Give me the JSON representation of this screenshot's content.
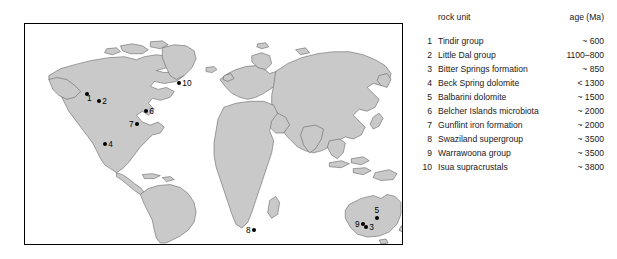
{
  "figure": {
    "background_color": "#ffffff",
    "land_fill_color": "#c9c9c9",
    "land_stroke_color": "#5a5a5a",
    "marker_color": "#000000",
    "map_border_color": "#000000"
  },
  "map": {
    "title": "",
    "projection_note": "",
    "markers": [
      {
        "id": "1",
        "label": "1",
        "x": 62,
        "y": 70,
        "label_side": "left",
        "region": "northwest-north-america"
      },
      {
        "id": "2",
        "label": "2",
        "x": 74,
        "y": 77,
        "label_side": "right",
        "region": "northwest-canada"
      },
      {
        "id": "3",
        "label": "3",
        "x": 341,
        "y": 203,
        "label_side": "right",
        "region": "central-australia"
      },
      {
        "id": "4",
        "label": "4",
        "x": 80,
        "y": 120,
        "label_side": "right",
        "region": "southwest-usa"
      },
      {
        "id": "5",
        "label": "5",
        "x": 352,
        "y": 192,
        "label_side": "left",
        "region": "northern-australia"
      },
      {
        "id": "6",
        "label": "6",
        "x": 121,
        "y": 87,
        "label_side": "right",
        "region": "hudson-bay"
      },
      {
        "id": "7",
        "label": "7",
        "x": 112,
        "y": 100,
        "label_side": "left",
        "region": "great-lakes"
      },
      {
        "id": "8",
        "label": "8",
        "x": 229,
        "y": 206,
        "label_side": "left",
        "region": "southern-africa"
      },
      {
        "id": "9",
        "label": "9",
        "x": 338,
        "y": 200,
        "label_side": "left",
        "region": "western-australia"
      },
      {
        "id": "10",
        "label": "10",
        "x": 154,
        "y": 59,
        "label_side": "right",
        "region": "greenland"
      }
    ]
  },
  "legend": {
    "header": {
      "unit_label": "rock unit",
      "age_label": "age (Ma)"
    },
    "rows": [
      {
        "num": "1",
        "unit": "Tindir group",
        "age": "~ 600"
      },
      {
        "num": "2",
        "unit": "Little Dal group",
        "age": "1100–800"
      },
      {
        "num": "3",
        "unit": "Bitter Springs formation",
        "age": "~ 850"
      },
      {
        "num": "4",
        "unit": "Beck Spring dolomite",
        "age": "< 1300"
      },
      {
        "num": "5",
        "unit": "Balbarini dolomite",
        "age": "~ 1500"
      },
      {
        "num": "6",
        "unit": "Belcher Islands microbiota",
        "age": "~ 2000"
      },
      {
        "num": "7",
        "unit": "Gunflint iron formation",
        "age": "~ 2000"
      },
      {
        "num": "8",
        "unit": "Swaziland supergroup",
        "age": "~ 3500"
      },
      {
        "num": "9",
        "unit": "Warrawoona group",
        "age": "~ 3500"
      },
      {
        "num": "10",
        "unit": "Isua supracrustals",
        "age": "~ 3800"
      }
    ]
  }
}
